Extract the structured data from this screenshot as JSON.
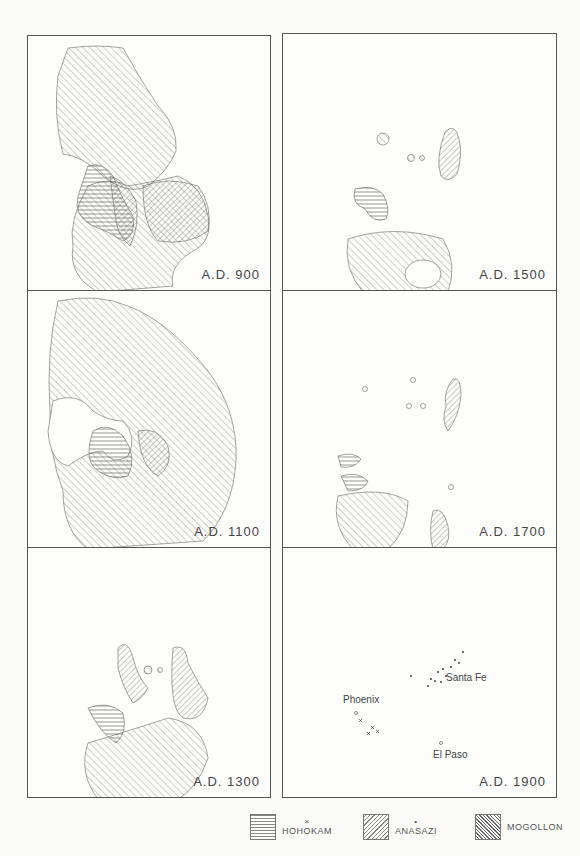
{
  "figure": {
    "panels": [
      {
        "id": "ad900",
        "label": "A.D. 900"
      },
      {
        "id": "ad1500",
        "label": "A.D. 1500"
      },
      {
        "id": "ad1100",
        "label": "A.D. 1100"
      },
      {
        "id": "ad1700",
        "label": "A.D. 1700"
      },
      {
        "id": "ad1300",
        "label": "A.D. 1300"
      },
      {
        "id": "ad1900",
        "label": "A.D. 1900"
      }
    ],
    "cities": {
      "phoenix": "Phoenix",
      "santa_fe": "Santa Fe",
      "el_paso": "El Paso"
    },
    "legend": [
      {
        "name": "HOHOKAM",
        "symbol": "×",
        "pattern": "horizontal-hatch"
      },
      {
        "name": "ANASAZI",
        "symbol": "•",
        "pattern": "diagonal-hatch-right"
      },
      {
        "name": "MOGOLLON",
        "symbol": "",
        "pattern": "diagonal-hatch-left"
      }
    ],
    "colors": {
      "ink": "#555555",
      "paper": "#fbfbfa",
      "river": "#999999"
    }
  }
}
